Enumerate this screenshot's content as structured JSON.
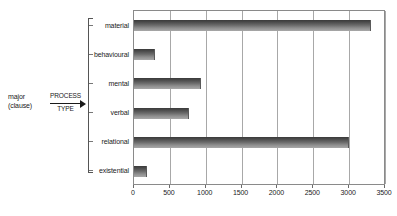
{
  "annotation": {
    "major_line1": "major",
    "major_line2": "(clause)",
    "arrow_top": "PROCESS",
    "arrow_bottom": "TYPE",
    "arrow_icon": "right-arrow-icon",
    "bracket_icon": "bracket-icon"
  },
  "chart_data": {
    "type": "bar",
    "orientation": "horizontal",
    "title": "",
    "xlabel": "",
    "ylabel": "",
    "categories": [
      "material",
      "behavioural",
      "mental",
      "verbal",
      "relational",
      "existential"
    ],
    "values": [
      3300,
      290,
      940,
      760,
      3000,
      180
    ],
    "xlim": [
      0,
      3500
    ],
    "xticks": [
      0,
      500,
      1000,
      1500,
      2000,
      2500,
      3000,
      3500
    ],
    "xtick_labels": [
      "0",
      "500",
      "1000",
      "1500",
      "2000",
      "2500",
      "3000",
      "3500"
    ],
    "grid": "vertical",
    "legend": "none",
    "bar_color_top": "#3a3a3a",
    "bar_color_bottom": "#a8a8a8",
    "gridline_color": "#a8a8a8",
    "axis_color": "#8a8a8a",
    "background": "#ffffff"
  }
}
